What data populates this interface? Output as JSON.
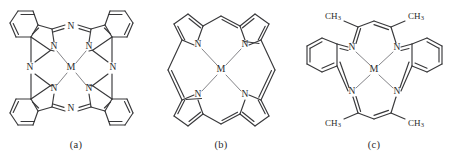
{
  "figure": {
    "background_color": "#ffffff",
    "line_color": "#39393b",
    "coordinate_bond_color": "#6e6e72",
    "text_color": "#2b2b2b",
    "panel_count": 3
  },
  "panels": [
    {
      "id": "a",
      "caption": "(a)",
      "structure_name": "metal-phthalocyanine",
      "metal_label": "M",
      "pyrrole_nitrogen_label": "N",
      "meso_nitrogen_label": "N",
      "pyrrole_nitrogen_count": 4,
      "meso_nitrogen_count": 4,
      "benzene_ring_count": 4,
      "substituent_labels": []
    },
    {
      "id": "b",
      "caption": "(b)",
      "structure_name": "metal-porphyrin",
      "metal_label": "M",
      "pyrrole_nitrogen_label": "N",
      "pyrrole_nitrogen_count": 4,
      "meso_carbon_count": 4,
      "benzene_ring_count": 0,
      "substituent_labels": []
    },
    {
      "id": "c",
      "caption": "(c)",
      "structure_name": "metal-dibenzotetraaza-annulene",
      "metal_label": "M",
      "nitrogen_label": "N",
      "nitrogen_count": 4,
      "benzene_ring_count": 2,
      "methyl_label": "CH",
      "methyl_subscript": "3",
      "methyl_count": 4,
      "substituent_labels": [
        "CH3",
        "CH3",
        "CH3",
        "CH3"
      ]
    }
  ]
}
